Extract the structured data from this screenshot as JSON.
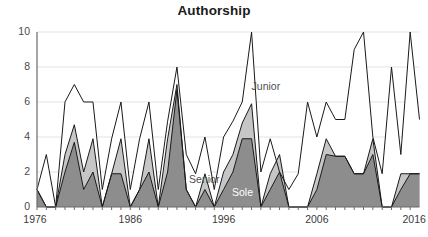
{
  "chart": {
    "title": "Authorship",
    "annotations": [
      {
        "text": "Junior",
        "x_year": 1999.0,
        "y_value": 6.7,
        "color": "#4f4f4f"
      },
      {
        "text": "Senior",
        "x_year": 1992.3,
        "y_value": 1.35,
        "color": "#4f4f4f"
      },
      {
        "text": "Sole",
        "x_year": 1996.9,
        "y_value": 0.62,
        "color": "#ffffff"
      }
    ]
  },
  "chart_data": {
    "type": "area",
    "stacked": true,
    "title": "Authorship",
    "xlabel": "",
    "ylabel": "",
    "xlim": [
      1976,
      2017
    ],
    "ylim": [
      0,
      10
    ],
    "yticks": [
      0,
      2,
      4,
      6,
      8,
      10
    ],
    "xticks": [
      1976,
      1986,
      1996,
      2006,
      2016
    ],
    "xtick_labels": [
      "1976",
      "1986",
      "1996",
      "2006",
      "2016"
    ],
    "ytick_labels": [
      "0",
      "2",
      "4",
      "6",
      "8",
      "10"
    ],
    "grid": "horizontal",
    "legend": "inline-annotations",
    "colors": {
      "sole": "#8d8d8d",
      "senior": "#c6c6c6",
      "junior": "#ffffff",
      "line": "#1a1a1a",
      "gridline": "#e3e3e3",
      "axis": "#6a6a6a",
      "text": "#3a3a3a"
    },
    "x": [
      1976,
      1977,
      1978,
      1979,
      1980,
      1981,
      1982,
      1983,
      1984,
      1985,
      1986,
      1987,
      1988,
      1989,
      1990,
      1991,
      1992,
      1993,
      1994,
      1995,
      1996,
      1997,
      1998,
      1999,
      2000,
      2001,
      2002,
      2003,
      2004,
      2005,
      2006,
      2007,
      2008,
      2009,
      2010,
      2011,
      2012,
      2013,
      2014,
      2015,
      2016,
      2017
    ],
    "series": [
      {
        "name": "Sole",
        "fill": "#8d8d8d",
        "values": [
          1,
          0,
          0,
          2,
          3.7,
          1,
          2,
          0,
          1.9,
          1.9,
          0,
          1,
          2,
          0,
          2,
          6.7,
          1,
          0,
          1,
          0,
          1,
          2,
          3.9,
          3.9,
          0,
          1,
          2,
          0,
          0,
          0,
          1,
          3,
          2.9,
          2.9,
          1.9,
          1.9,
          3,
          0,
          0,
          1,
          1.9,
          1.9
        ]
      },
      {
        "name": "Senior",
        "fill": "#c6c6c6",
        "values": [
          1,
          0,
          0,
          3,
          4.7,
          2,
          3.9,
          0,
          1.9,
          3.9,
          0,
          1,
          3.9,
          0,
          3.9,
          7,
          1,
          0,
          1.9,
          0,
          2,
          3,
          4.8,
          5.9,
          0,
          1.9,
          3,
          0,
          0,
          0,
          1.9,
          3.9,
          2.9,
          2.9,
          1.9,
          1.9,
          3.9,
          0,
          0,
          1.9,
          1.9,
          1.9
        ]
      },
      {
        "name": "Junior",
        "fill": "#ffffff",
        "values": [
          1,
          3,
          0,
          6,
          7,
          6,
          6,
          1,
          3.9,
          6,
          1,
          3.9,
          6,
          1,
          4.9,
          8,
          3,
          1.9,
          4,
          1,
          4,
          4.9,
          6,
          10,
          2,
          3.9,
          2,
          1,
          1.9,
          6,
          4,
          6,
          5,
          5,
          9,
          10,
          4,
          1.9,
          8,
          3,
          10,
          5
        ]
      }
    ]
  }
}
